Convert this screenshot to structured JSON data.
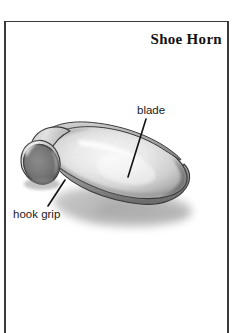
{
  "page": {
    "background_color": "#ffffff",
    "frame_color": "#3a3a3a"
  },
  "header": {
    "title": "Shoe Horn"
  },
  "illustration": {
    "subject": "shoe-horn",
    "style": "pencil-shaded line drawing, grayscale",
    "description": "A shoe horn shown in three-quarter view lying on a surface, with a curled open hook at the left end and a broad rounded scoop blade at the right end, casting a soft gray shadow.",
    "palette": {
      "outline": "#2b2b2b",
      "body_light": "#f2f2f2",
      "body_mid": "#cccccc",
      "body_dark": "#8f8f8f",
      "hook_opening_dark": "#6b6b6b",
      "shadow": "#b5b5b5"
    }
  },
  "callouts": [
    {
      "id": "blade",
      "label": "blade",
      "leader_from": [
        146,
        119
      ],
      "leader_to": [
        128,
        177
      ]
    },
    {
      "id": "hook-grip",
      "label": "hook grip",
      "leader_from": [
        65,
        180
      ],
      "leader_to": [
        48,
        206
      ]
    }
  ]
}
